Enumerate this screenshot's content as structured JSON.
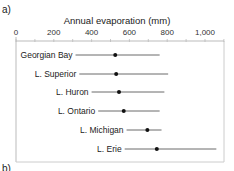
{
  "panel_labels": {
    "a": "a)",
    "b": "b)"
  },
  "chart_data": {
    "type": "range-dot",
    "title": "",
    "xlabel": "Annual evaporation (mm)",
    "ylabel": "",
    "xlim": [
      0,
      1100
    ],
    "xticks": [
      0,
      200,
      400,
      600,
      800,
      1000
    ],
    "xtick_labels": [
      "0",
      "200",
      "400",
      "600",
      "800",
      "1,000"
    ],
    "grid": false,
    "categories": [
      "Georgian Bay",
      "L. Superior",
      "L. Huron",
      "L. Ontario",
      "L. Michigan",
      "L. Erie"
    ],
    "series": [
      {
        "name": "mean",
        "values": [
          525,
          530,
          545,
          570,
          695,
          745
        ]
      },
      {
        "name": "min",
        "values": [
          315,
          335,
          400,
          435,
          585,
          575
        ]
      },
      {
        "name": "max",
        "values": [
          760,
          805,
          785,
          760,
          770,
          1060
        ]
      }
    ]
  }
}
